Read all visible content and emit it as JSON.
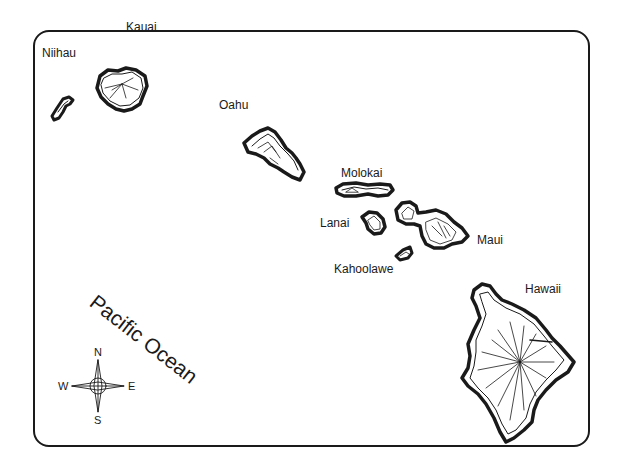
{
  "map": {
    "title": "Hawaiian Islands",
    "islands": [
      {
        "name": "Niihau"
      },
      {
        "name": "Kauai"
      },
      {
        "name": "Oahu"
      },
      {
        "name": "Molokai"
      },
      {
        "name": "Lanai"
      },
      {
        "name": "Maui"
      },
      {
        "name": "Kahoolawe"
      },
      {
        "name": "Hawaii"
      }
    ],
    "ocean_label": "Pacific Ocean",
    "compass": {
      "n": "N",
      "s": "S",
      "e": "E",
      "w": "W"
    },
    "colors": {
      "ink": "#1a1a1a",
      "background": "#ffffff"
    }
  }
}
